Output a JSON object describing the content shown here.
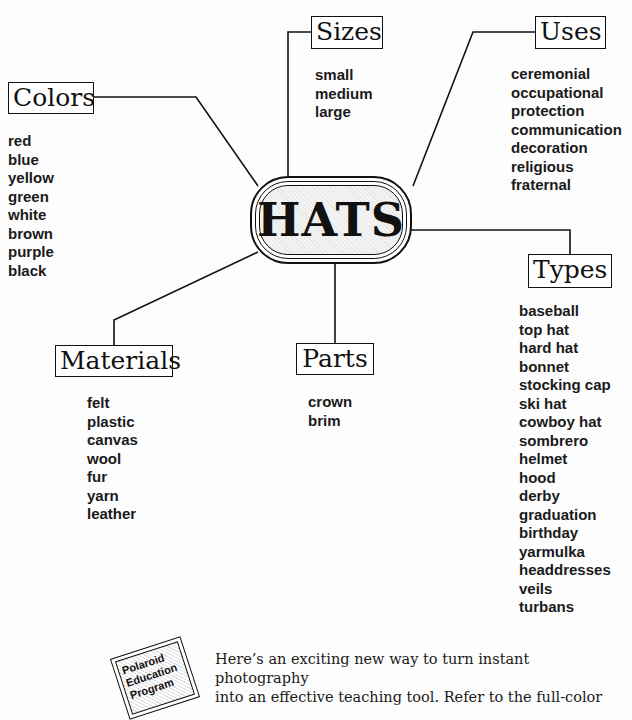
{
  "center": {
    "title": "HATS"
  },
  "categories": {
    "colors": {
      "label": "Colors",
      "items": [
        "red",
        "blue",
        "yellow",
        "green",
        "white",
        "brown",
        "purple",
        "black"
      ]
    },
    "sizes": {
      "label": "Sizes",
      "items": [
        "small",
        "medium",
        "large"
      ]
    },
    "uses": {
      "label": "Uses",
      "items": [
        "ceremonial",
        "occupational",
        "protection",
        "communication",
        "decoration",
        "religious",
        "fraternal"
      ]
    },
    "types": {
      "label": "Types",
      "items": [
        "baseball",
        "top hat",
        "hard hat",
        "bonnet",
        "stocking cap",
        "ski hat",
        "cowboy hat",
        "sombrero",
        "helmet",
        "hood",
        "derby",
        "graduation",
        "birthday",
        "yarmulka",
        "headdresses",
        "veils",
        "turbans"
      ]
    },
    "materials": {
      "label": "Materials",
      "items": [
        "felt",
        "plastic",
        "canvas",
        "wool",
        "fur",
        "yarn",
        "leather"
      ]
    },
    "parts": {
      "label": "Parts",
      "items": [
        "crown",
        "brim"
      ]
    }
  },
  "logo": {
    "lines": [
      "Polaroid",
      "Education",
      "Program"
    ]
  },
  "footer": {
    "lines": [
      "Here’s an exciting new way to turn instant photography",
      "into an effective teaching tool. Refer to the full-color"
    ]
  }
}
